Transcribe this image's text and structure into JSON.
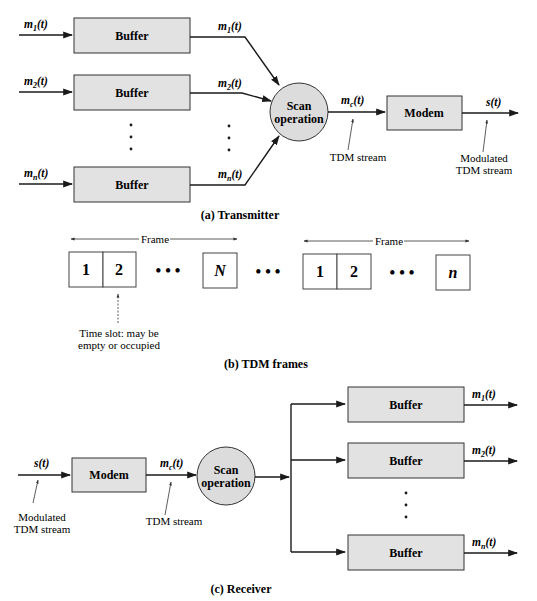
{
  "transmitter": {
    "caption": "(a) Transmitter",
    "inputs": [
      "m1(t)",
      "m2(t)",
      "mn(t)"
    ],
    "input_labels": [
      {
        "m": "m",
        "sub": "1",
        "t": "(t)"
      },
      {
        "m": "m",
        "sub": "2",
        "t": "(t)"
      },
      {
        "m": "m",
        "sub": "n",
        "t": "(t)"
      }
    ],
    "buffer_label": "Buffer",
    "scan_label_line1": "Scan",
    "scan_label_line2": "operation",
    "mc_label": {
      "m": "m",
      "sub": "c",
      "t": "(t)"
    },
    "modem_label": "Modem",
    "output_label": "s(t)",
    "tdm_stream_note": "TDM stream",
    "modulated_note_line1": "Modulated",
    "modulated_note_line2": "TDM stream"
  },
  "frames": {
    "caption": "(b) TDM frames",
    "frame_label": "Frame",
    "frame1_slots": [
      "1",
      "2",
      "N"
    ],
    "frame2_slots": [
      "1",
      "2",
      "n"
    ],
    "ellipsis": "• • •",
    "slot_note_line1": "Time slot: may be",
    "slot_note_line2": "empty or occupied"
  },
  "receiver": {
    "caption": "(c) Receiver",
    "input_label": "s(t)",
    "modem_label": "Modem",
    "mc_label": {
      "m": "m",
      "sub": "c",
      "t": "(t)"
    },
    "scan_label_line1": "Scan",
    "scan_label_line2": "operation",
    "buffer_label": "Buffer",
    "outputs": [
      {
        "m": "m",
        "sub": "1",
        "t": "(t)"
      },
      {
        "m": "m",
        "sub": "2",
        "t": "(t)"
      },
      {
        "m": "m",
        "sub": "n",
        "t": "(t)"
      }
    ],
    "tdm_stream_note": "TDM stream",
    "modulated_note_line1": "Modulated",
    "modulated_note_line2": "TDM stream"
  }
}
